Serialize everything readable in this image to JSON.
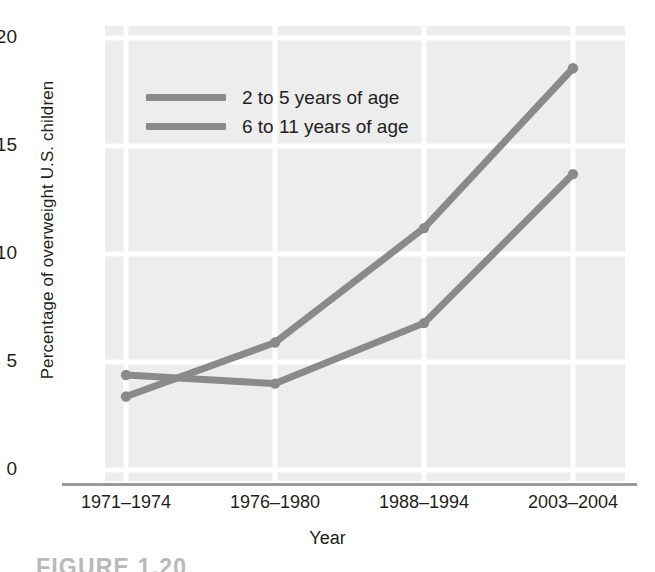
{
  "figure": {
    "caption": "FIGURE 1.20"
  },
  "chart_data": {
    "type": "line",
    "title": "",
    "xlabel": "Year",
    "ylabel": "Percentage of overweight U.S. children",
    "categories": [
      "1971–1974",
      "1976–1980",
      "1988–1994",
      "2003–2004"
    ],
    "series": [
      {
        "name": "2 to 5 years of age",
        "color": "#8a8a8a",
        "values": [
          3.4,
          5.9,
          11.2,
          18.6
        ]
      },
      {
        "name": "6 to 11 years of age",
        "color": "#8a8a8a",
        "values": [
          4.4,
          4.0,
          6.8,
          13.7
        ]
      }
    ],
    "ylim": [
      0,
      20
    ],
    "yticks": [
      0,
      5,
      10,
      15,
      20
    ],
    "ytick_labels": [
      "0",
      "5",
      "10",
      "15",
      "20"
    ],
    "grid": true,
    "grid_color": "#ffffff",
    "panel_color": "#ededed",
    "legend_position": "upper-left",
    "marker": "circle"
  }
}
